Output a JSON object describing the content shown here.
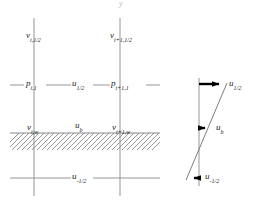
{
  "figure": {
    "background_color": "#ffffff",
    "line_color": "#6e6e6e",
    "grid_line_color": "#8a8a8a",
    "arrow_color": "#000000",
    "hatch_color": "#7a7a7a",
    "top_artifact": "y"
  },
  "grid": {
    "labels": [
      {
        "id": "v-i-half",
        "base": "v",
        "sub": "i,1/2",
        "x": 26,
        "y": 31
      },
      {
        "id": "v-ip1-half",
        "base": "v",
        "sub": "i+1,1/2",
        "x": 110,
        "y": 31
      },
      {
        "id": "p-i-1",
        "base": "p",
        "sub": "i,1",
        "x": 26,
        "y": 80
      },
      {
        "id": "u-half",
        "base": "u",
        "sub": "1/2",
        "x": 73,
        "y": 80
      },
      {
        "id": "p-ip1-1",
        "base": "p",
        "sub": "i+1,1",
        "x": 111,
        "y": 80
      },
      {
        "id": "v-i-w",
        "base": "v",
        "sub": "i,w",
        "x": 27,
        "y": 121
      },
      {
        "id": "u-b",
        "base": "u",
        "sub": "b",
        "x": 75,
        "y": 120
      },
      {
        "id": "v-ip1-w",
        "base": "v",
        "sub": "i+1,w",
        "x": 112,
        "y": 121
      },
      {
        "id": "u-minus-half",
        "base": "u",
        "sub": "-1/2",
        "x": 73,
        "y": 172
      }
    ]
  },
  "profile": {
    "labels": [
      {
        "id": "profile-u-half",
        "base": "u",
        "sub": "1/2",
        "x": 229,
        "y": 80
      },
      {
        "id": "profile-u-b",
        "base": "u",
        "sub": "b",
        "x": 216,
        "y": 124
      },
      {
        "id": "profile-u-minus-half",
        "base": "u",
        "sub": "-1/2",
        "x": 205,
        "y": 171
      }
    ],
    "axis_x": 199,
    "axis_top": 78,
    "axis_bottom": 186,
    "vectors": [
      {
        "id": "vec-u-half",
        "x1": 199,
        "y1": 84,
        "x2": 226,
        "y2": 84,
        "weight": "heavy"
      },
      {
        "id": "vec-u-b",
        "x1": 199,
        "y1": 128,
        "x2": 212,
        "y2": 128,
        "weight": "heavy"
      },
      {
        "id": "vec-u-minus-half",
        "x1": 199,
        "y1": 178,
        "x2": 188,
        "y2": 178,
        "weight": "heavy"
      }
    ],
    "profile_line": {
      "x1": 227,
      "y1": 83,
      "x2": 186,
      "y2": 180
    }
  },
  "hatching": {
    "boundary_y": 133,
    "left": 10,
    "right": 160,
    "depth": 17,
    "stroke_count": 30
  }
}
